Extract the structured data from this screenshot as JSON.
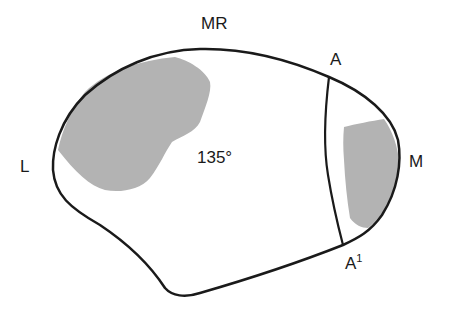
{
  "diagram": {
    "labels": {
      "top": "MR",
      "left": "L",
      "right": "M",
      "line_top": "A",
      "line_bottom": "A",
      "line_bottom_sup": "1",
      "angle": "135°"
    },
    "colors": {
      "outline": "#1a1a1a",
      "shaded": "#b3b3b3",
      "background": "#ffffff"
    }
  }
}
